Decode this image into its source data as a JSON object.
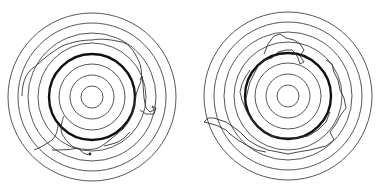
{
  "figure": {
    "panels": [
      {
        "name": "left-target",
        "center": [
          92,
          97
        ],
        "ring_radii": [
          84,
          74,
          64,
          54,
          43,
          33,
          22,
          11
        ],
        "bold_ring_radius": 43,
        "ring_color": "#444444",
        "trace_color": "#333333"
      },
      {
        "name": "right-target",
        "center": [
          288,
          96
        ],
        "ring_radii": [
          84,
          74,
          64,
          54,
          43,
          33,
          22,
          11
        ],
        "bold_ring_radius": 43,
        "ring_color": "#444444",
        "trace_color": "#333333"
      }
    ]
  }
}
